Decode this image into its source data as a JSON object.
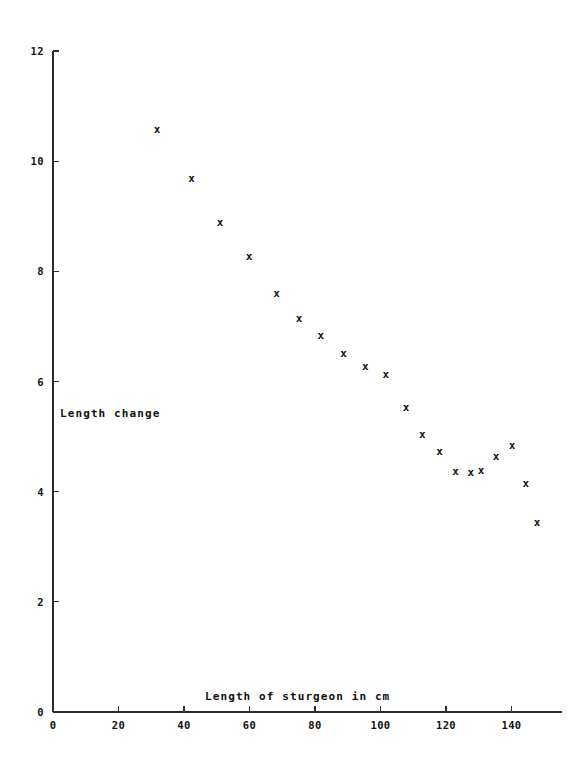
{
  "chart_data": {
    "type": "scatter",
    "title": "",
    "xlabel": "Length of sturgeon in cm",
    "ylabel": "Length change",
    "xlim": [
      0,
      152
    ],
    "ylim": [
      0,
      12
    ],
    "xticks": [
      0,
      20,
      40,
      60,
      80,
      100,
      120,
      140
    ],
    "xtick_labels": [
      "0",
      "20",
      "40",
      "60",
      "80",
      "100",
      "120",
      "140"
    ],
    "yticks": [
      0,
      2,
      4,
      6,
      8,
      10,
      12
    ],
    "ytick_labels": [
      "0",
      "2",
      "4",
      "6",
      "8",
      "10",
      "12"
    ],
    "grid": false,
    "legend": null,
    "marker": "x",
    "marker_color": "#151515",
    "axis_color": "#2b2b2b",
    "x": [
      31.8,
      42.3,
      51.0,
      59.9,
      68.3,
      75.1,
      81.8,
      88.7,
      95.4,
      101.6,
      107.8,
      112.8,
      118.0,
      122.9,
      127.6,
      130.7,
      135.3,
      140.2,
      144.4,
      147.8
    ],
    "y": [
      10.58,
      9.69,
      8.89,
      8.27,
      7.6,
      7.15,
      6.84,
      6.51,
      6.29,
      6.13,
      5.53,
      5.05,
      4.73,
      4.38,
      4.35,
      4.4,
      4.64,
      4.84,
      4.16,
      3.45
    ],
    "points": [
      {
        "x": 31.8,
        "y": 10.58
      },
      {
        "x": 42.3,
        "y": 9.69
      },
      {
        "x": 51.0,
        "y": 8.89
      },
      {
        "x": 59.9,
        "y": 8.27
      },
      {
        "x": 68.3,
        "y": 7.6
      },
      {
        "x": 75.1,
        "y": 7.15
      },
      {
        "x": 81.8,
        "y": 6.84
      },
      {
        "x": 88.7,
        "y": 6.51
      },
      {
        "x": 95.4,
        "y": 6.29
      },
      {
        "x": 101.6,
        "y": 6.13
      },
      {
        "x": 107.8,
        "y": 5.53
      },
      {
        "x": 112.8,
        "y": 5.05
      },
      {
        "x": 118.0,
        "y": 4.73
      },
      {
        "x": 122.9,
        "y": 4.38
      },
      {
        "x": 127.6,
        "y": 4.35
      },
      {
        "x": 130.7,
        "y": 4.4
      },
      {
        "x": 135.3,
        "y": 4.64
      },
      {
        "x": 140.2,
        "y": 4.84
      },
      {
        "x": 144.4,
        "y": 4.16
      },
      {
        "x": 147.8,
        "y": 3.45
      }
    ]
  },
  "geometry": {
    "x_origin_px": 53,
    "y_origin_px": 712,
    "x_scale_px_per_unit": 3.275,
    "y_scale_px_per_unit": 55.08,
    "tick_len_px": 6,
    "x_axis_right_px": 562,
    "y_axis_top_px": 51,
    "ylabel_x_px": 60,
    "ylabel_y_px": 417,
    "xlabel_x_px": 205,
    "xlabel_y_px": 700
  }
}
